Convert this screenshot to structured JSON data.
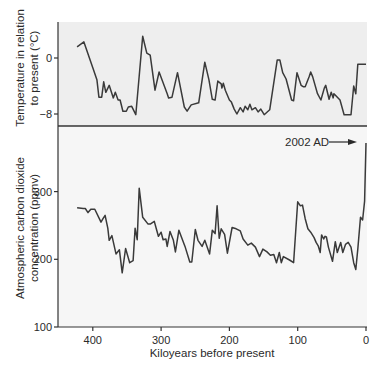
{
  "colors": {
    "panel_top_bg": "#eeeeee",
    "panel_bottom_bg": "#f6f6f6",
    "line": "#3a3a3a",
    "axis": "#333333",
    "text": "#2a2a2a"
  },
  "annotation": {
    "label": "2002 AD",
    "arrow": "right-arrow"
  },
  "chart_data": [
    {
      "type": "line",
      "title": "",
      "xlabel": "Kiloyears before present",
      "ylabel": "Temperature in relation to present (°C)",
      "ylabel_lines": [
        "Temperature in relation",
        "to present (°C)"
      ],
      "xlim": [
        440,
        0
      ],
      "ylim": [
        -9.5,
        5.2
      ],
      "xticks": [
        400,
        300,
        200,
        100,
        0
      ],
      "yticks": [
        0,
        -8
      ],
      "ytick_labels": [
        "0",
        "−8"
      ],
      "grid": false,
      "series": [
        {
          "name": "Temperature",
          "x": [
            423,
            413,
            400,
            394,
            391,
            387,
            384,
            381,
            376,
            370,
            367,
            363,
            360,
            356,
            351,
            348,
            343,
            337,
            327,
            321,
            316,
            309,
            303,
            291,
            289,
            284,
            276,
            266,
            262,
            256,
            245,
            236,
            230,
            225,
            221,
            217,
            212,
            211,
            209,
            206,
            200,
            197,
            193,
            189,
            184,
            180,
            177,
            173,
            170,
            167,
            162,
            158,
            154,
            149,
            141,
            130,
            126,
            122,
            117,
            109,
            106,
            101,
            95,
            92,
            89,
            83,
            81,
            78,
            71,
            66,
            61,
            59,
            54,
            51,
            48,
            47,
            44,
            38,
            32,
            22,
            18,
            15,
            12,
            6,
            0
          ],
          "values": [
            1.6,
            2.3,
            -1.4,
            -3.1,
            -5.6,
            -5.6,
            -3.4,
            -4.9,
            -3.9,
            -5.7,
            -4.9,
            -6,
            -6,
            -7.6,
            -7.6,
            -7,
            -6.9,
            -8.1,
            3.1,
            0.7,
            0.4,
            -4.6,
            -2,
            -5.1,
            -5.7,
            -5.6,
            -2.1,
            -7,
            -7.6,
            -6.7,
            -6.4,
            -0.6,
            -3.1,
            -5.9,
            -6,
            -3.3,
            -3.7,
            -4.3,
            -3.6,
            -4.6,
            -6,
            -6.3,
            -7.3,
            -8,
            -7.1,
            -7.7,
            -6.9,
            -7.4,
            -6.6,
            -7.4,
            -7.1,
            -7.7,
            -7.3,
            -8.1,
            -7.4,
            -0.3,
            -0.3,
            -2.1,
            -3,
            -6,
            -6.1,
            -2.1,
            -3.9,
            -4.1,
            -4.1,
            -2.6,
            -2,
            -2.7,
            -5.1,
            -6,
            -4.3,
            -3.9,
            -5.9,
            -4.9,
            -5.7,
            -5.1,
            -5.4,
            -6,
            -8.1,
            -8.1,
            -4,
            -5.1,
            -0.9,
            -0.9,
            -0.9
          ]
        }
      ]
    },
    {
      "type": "line",
      "title": "",
      "xlabel": "Kiloyears before present",
      "ylabel": "Atmospheric carbon dioxide concentration (ppmv)",
      "ylabel_lines": [
        "Atmospheric carbon dioxide",
        "concentration (ppmv)"
      ],
      "xlim": [
        440,
        0
      ],
      "ylim": [
        100,
        398
      ],
      "xticks": [
        400,
        300,
        200,
        100,
        0
      ],
      "xtick_labels": [
        "400",
        "300",
        "200",
        "100",
        "0"
      ],
      "yticks": [
        300,
        200,
        100
      ],
      "ytick_labels": [
        "300",
        "200",
        "100"
      ],
      "grid": false,
      "annotations": [
        {
          "text": "2002 AD",
          "x": 0,
          "y": 372,
          "arrow": true
        }
      ],
      "series": [
        {
          "name": "CO2",
          "x": [
            423,
            414,
            411,
            407,
            403,
            397,
            388,
            385,
            382,
            378,
            376,
            372,
            366,
            361,
            357,
            352,
            346,
            341,
            338,
            335,
            332,
            327,
            319,
            316,
            310,
            307,
            304,
            300,
            297,
            293,
            291,
            287,
            282,
            279,
            274,
            270,
            265,
            258,
            255,
            250,
            246,
            240,
            236,
            229,
            225,
            221,
            218,
            215,
            212,
            207,
            203,
            196,
            190,
            184,
            180,
            173,
            168,
            162,
            156,
            151,
            145,
            140,
            135,
            131,
            127,
            124,
            121,
            112,
            106,
            100,
            96,
            93,
            89,
            85,
            81,
            76,
            73,
            70,
            67,
            65,
            62,
            60,
            58,
            55,
            49,
            45,
            42,
            37,
            34,
            30,
            26,
            22,
            18,
            15,
            12,
            8,
            5,
            2,
            0
          ],
          "values": [
            276,
            275,
            275,
            269,
            274,
            274,
            255,
            260,
            265,
            246,
            228,
            235,
            208,
            214,
            180,
            216,
            195,
            198,
            246,
            229,
            305,
            262,
            252,
            252,
            256,
            245,
            234,
            240,
            229,
            230,
            219,
            241,
            228,
            211,
            243,
            232,
            219,
            196,
            196,
            244,
            228,
            219,
            228,
            208,
            243,
            238,
            279,
            231,
            245,
            237,
            209,
            247,
            245,
            242,
            230,
            221,
            224,
            218,
            204,
            215,
            211,
            206,
            207,
            195,
            210,
            195,
            204,
            199,
            195,
            285,
            279,
            280,
            260,
            245,
            240,
            232,
            225,
            220,
            210,
            236,
            230,
            234,
            233,
            218,
            197,
            226,
            210,
            225,
            210,
            222,
            225,
            218,
            195,
            185,
            215,
            262,
            258,
            286,
            372
          ]
        }
      ]
    }
  ]
}
